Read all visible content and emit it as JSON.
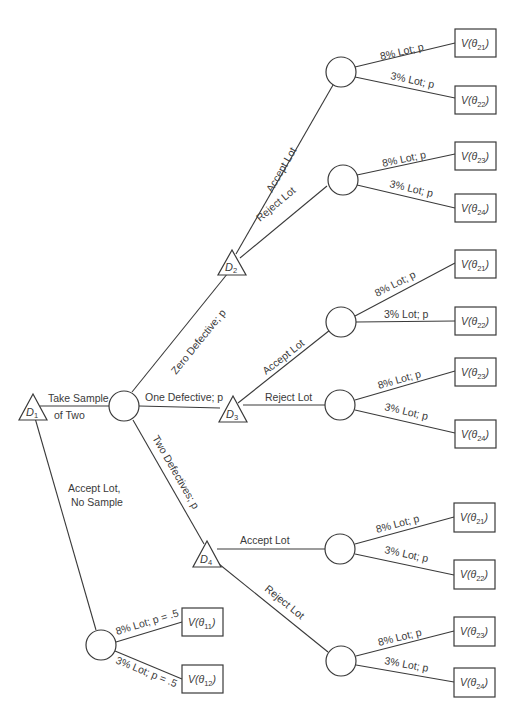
{
  "diagram": {
    "type": "decision-tree",
    "decision_nodes": [
      {
        "id": "D1",
        "label": "D",
        "sub": "1"
      },
      {
        "id": "D2",
        "label": "D",
        "sub": "2"
      },
      {
        "id": "D3",
        "label": "D",
        "sub": "3"
      },
      {
        "id": "D4",
        "label": "D",
        "sub": "4"
      }
    ],
    "branches": {
      "take_sample_line1": "Take Sample",
      "take_sample_line2": "of Two",
      "no_sample_line1": "Accept Lot,",
      "no_sample_line2": "No Sample",
      "zero_defective": "Zero Defective; p",
      "one_defective": "One Defective; p",
      "two_defectives": "Two Defectives; p",
      "accept_lot": "Accept Lot",
      "reject_lot": "Reject Lot",
      "lot8": "8% Lot; p",
      "lot3": "3% Lot; p",
      "lot8_half": "8% Lot; p = .5",
      "lot3_half": "3% Lot; p = .5"
    },
    "terminals": {
      "v11": {
        "pre": "V(θ",
        "sub": "11",
        "post": ")"
      },
      "v12": {
        "pre": "V(θ",
        "sub": "12",
        "post": ")"
      },
      "v21": {
        "pre": "V(θ",
        "sub": "21",
        "post": ")"
      },
      "v22": {
        "pre": "V(θ",
        "sub": "22",
        "post": ")"
      },
      "v23": {
        "pre": "V(θ",
        "sub": "23",
        "post": ")"
      },
      "v24": {
        "pre": "V(θ",
        "sub": "24",
        "post": ")"
      }
    },
    "colors": {
      "stroke": "#3a3a3a",
      "background": "#ffffff"
    }
  }
}
